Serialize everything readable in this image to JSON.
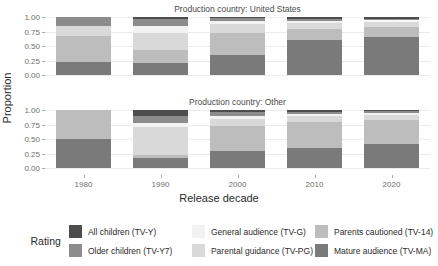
{
  "chart_data": {
    "type": "bar",
    "subtype": "stacked-proportional-faceted",
    "title": "",
    "xlabel": "Release decade",
    "ylabel": "Proportion",
    "categories": [
      "1980",
      "1990",
      "2000",
      "2010",
      "2020"
    ],
    "ylim": [
      0,
      1
    ],
    "yticks": [
      "0.00",
      "0.25",
      "0.50",
      "0.75",
      "1.00"
    ],
    "ytick_values": [
      0,
      0.25,
      0.5,
      0.75,
      1
    ],
    "grid": true,
    "legend_position": "bottom",
    "legend_title": "Rating",
    "series": [
      {
        "name": "All children (TV-Y)",
        "key": "TV-Y",
        "color": "#4d4d4d"
      },
      {
        "name": "Older children (TV-Y7)",
        "key": "TV-Y7",
        "color": "#8c8c8c"
      },
      {
        "name": "General audience (TV-G)",
        "key": "TV-G",
        "color": "#f2f2f2"
      },
      {
        "name": "Parental guidance (TV-PG)",
        "key": "TV-PG",
        "color": "#d9d9d9"
      },
      {
        "name": "Parents cautioned (TV-14)",
        "key": "TV-14",
        "color": "#bdbdbd"
      },
      {
        "name": "Mature audience (TV-MA)",
        "key": "TV-MA",
        "color": "#7a7a7a"
      }
    ],
    "facets": [
      {
        "label": "Production country: United States",
        "bars": [
          {
            "category": "1980",
            "segments": [
              {
                "key": "TV-Y",
                "value": 0.0
              },
              {
                "key": "TV-Y7",
                "value": 0.15
              },
              {
                "key": "TV-G",
                "value": 0.0
              },
              {
                "key": "TV-PG",
                "value": 0.18
              },
              {
                "key": "TV-14",
                "value": 0.45
              },
              {
                "key": "TV-MA",
                "value": 0.22
              }
            ]
          },
          {
            "category": "1990",
            "segments": [
              {
                "key": "TV-Y",
                "value": 0.03
              },
              {
                "key": "TV-Y7",
                "value": 0.12
              },
              {
                "key": "TV-G",
                "value": 0.12
              },
              {
                "key": "TV-PG",
                "value": 0.3
              },
              {
                "key": "TV-14",
                "value": 0.22
              },
              {
                "key": "TV-MA",
                "value": 0.21
              }
            ]
          },
          {
            "category": "2000",
            "segments": [
              {
                "key": "TV-Y",
                "value": 0.02
              },
              {
                "key": "TV-Y7",
                "value": 0.05
              },
              {
                "key": "TV-G",
                "value": 0.05
              },
              {
                "key": "TV-PG",
                "value": 0.16
              },
              {
                "key": "TV-14",
                "value": 0.38
              },
              {
                "key": "TV-MA",
                "value": 0.34
              }
            ]
          },
          {
            "category": "2010",
            "segments": [
              {
                "key": "TV-Y",
                "value": 0.03
              },
              {
                "key": "TV-Y7",
                "value": 0.04
              },
              {
                "key": "TV-G",
                "value": 0.03
              },
              {
                "key": "TV-PG",
                "value": 0.1
              },
              {
                "key": "TV-14",
                "value": 0.19
              },
              {
                "key": "TV-MA",
                "value": 0.61
              }
            ]
          },
          {
            "category": "2020",
            "segments": [
              {
                "key": "TV-Y",
                "value": 0.03
              },
              {
                "key": "TV-Y7",
                "value": 0.03
              },
              {
                "key": "TV-G",
                "value": 0.03
              },
              {
                "key": "TV-PG",
                "value": 0.09
              },
              {
                "key": "TV-14",
                "value": 0.17
              },
              {
                "key": "TV-MA",
                "value": 0.65
              }
            ]
          }
        ]
      },
      {
        "label": "Production country: Other",
        "bars": [
          {
            "category": "1980",
            "segments": [
              {
                "key": "TV-Y",
                "value": 0.0
              },
              {
                "key": "TV-Y7",
                "value": 0.0
              },
              {
                "key": "TV-G",
                "value": 0.0
              },
              {
                "key": "TV-PG",
                "value": 0.0
              },
              {
                "key": "TV-14",
                "value": 0.5
              },
              {
                "key": "TV-MA",
                "value": 0.5
              }
            ]
          },
          {
            "category": "1990",
            "segments": [
              {
                "key": "TV-Y",
                "value": 0.1
              },
              {
                "key": "TV-Y7",
                "value": 0.12
              },
              {
                "key": "TV-G",
                "value": 0.08
              },
              {
                "key": "TV-PG",
                "value": 0.48
              },
              {
                "key": "TV-14",
                "value": 0.05
              },
              {
                "key": "TV-MA",
                "value": 0.17
              }
            ]
          },
          {
            "category": "2000",
            "segments": [
              {
                "key": "TV-Y",
                "value": 0.04
              },
              {
                "key": "TV-Y7",
                "value": 0.06
              },
              {
                "key": "TV-G",
                "value": 0.05
              },
              {
                "key": "TV-PG",
                "value": 0.12
              },
              {
                "key": "TV-14",
                "value": 0.43
              },
              {
                "key": "TV-MA",
                "value": 0.3
              }
            ]
          },
          {
            "category": "2010",
            "segments": [
              {
                "key": "TV-Y",
                "value": 0.03
              },
              {
                "key": "TV-Y7",
                "value": 0.04
              },
              {
                "key": "TV-G",
                "value": 0.03
              },
              {
                "key": "TV-PG",
                "value": 0.11
              },
              {
                "key": "TV-14",
                "value": 0.44
              },
              {
                "key": "TV-MA",
                "value": 0.35
              }
            ]
          },
          {
            "category": "2020",
            "segments": [
              {
                "key": "TV-Y",
                "value": 0.02
              },
              {
                "key": "TV-Y7",
                "value": 0.03
              },
              {
                "key": "TV-G",
                "value": 0.03
              },
              {
                "key": "TV-PG",
                "value": 0.1
              },
              {
                "key": "TV-14",
                "value": 0.4
              },
              {
                "key": "TV-MA",
                "value": 0.42
              }
            ]
          }
        ]
      }
    ]
  },
  "legend": {
    "title": "Rating",
    "columns": [
      [
        {
          "label": "All children (TV-Y)",
          "color": "#4d4d4d"
        },
        {
          "label": "Older children (TV-Y7)",
          "color": "#8c8c8c"
        }
      ],
      [
        {
          "label": "General audience (TV-G)",
          "color": "#f2f2f2"
        },
        {
          "label": "Parental guidance (TV-PG)",
          "color": "#d9d9d9"
        }
      ],
      [
        {
          "label": "Parents cautioned (TV-14)",
          "color": "#bdbdbd"
        },
        {
          "label": "Mature audience (TV-MA)",
          "color": "#7a7a7a"
        }
      ]
    ]
  }
}
